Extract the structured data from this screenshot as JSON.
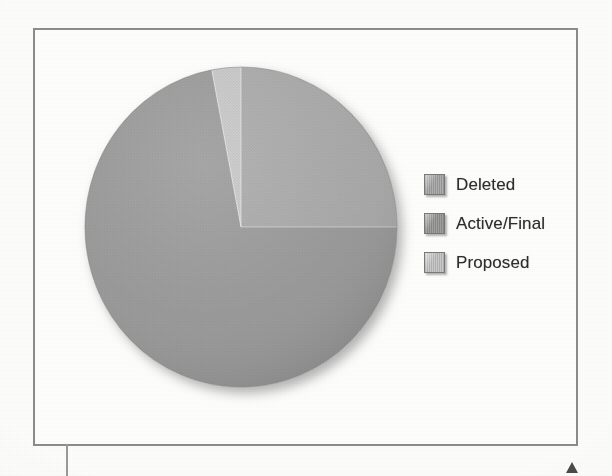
{
  "page": {
    "background_color": "#fdfdfc",
    "frame_color": "#8d8d8d",
    "marker_color": "#4b4b4b"
  },
  "chart_data": {
    "type": "pie",
    "title": "",
    "subtitle": "",
    "xlabel": "",
    "ylabel": "",
    "grid": false,
    "legend_position": "right",
    "start_angle_deg": 0,
    "direction": "clockwise",
    "categories": [
      "Deleted",
      "Active/Final",
      "Proposed"
    ],
    "values": [
      25,
      72,
      3
    ],
    "units": "percent",
    "slices": [
      {
        "label": "Deleted",
        "value": 25,
        "color": "#a9a9a9",
        "start_deg": 0,
        "end_deg": 90
      },
      {
        "label": "Active/Final",
        "value": 72,
        "color": "#999999",
        "start_deg": 90,
        "end_deg": 349
      },
      {
        "label": "Proposed",
        "value": 3,
        "color": "#c7c7c7",
        "start_deg": 349,
        "end_deg": 360
      }
    ],
    "legend": [
      {
        "label": "Deleted",
        "color": "#a9a9a9"
      },
      {
        "label": "Active/Final",
        "color": "#999999"
      },
      {
        "label": "Proposed",
        "color": "#c7c7c7"
      }
    ]
  },
  "legend": {
    "items": [
      {
        "label": "Deleted",
        "color": "#a9a9a9"
      },
      {
        "label": "Active/Final",
        "color": "#999999"
      },
      {
        "label": "Proposed",
        "color": "#c7c7c7"
      }
    ]
  }
}
